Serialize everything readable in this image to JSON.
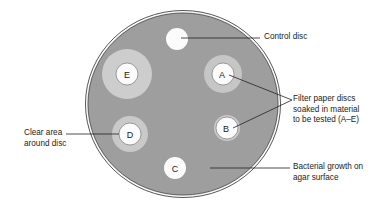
{
  "diagram": {
    "colors": {
      "background": "#ffffff",
      "agar": "#9e9e9e",
      "plate_rim": "#555555",
      "clear_zone": "#cdcdcd",
      "disc": "#fbfbfb",
      "leader_line": "#222222",
      "text": "#222222"
    },
    "plate": {
      "cx": 183,
      "cy": 104,
      "rx": 96,
      "ry": 92
    },
    "discs": [
      {
        "id": "control",
        "label": "",
        "cx": 177,
        "cy": 39,
        "r": 11,
        "zone_r": 0
      },
      {
        "id": "A",
        "label": "A",
        "cx": 223,
        "cy": 74,
        "r": 11,
        "zone_r": 19
      },
      {
        "id": "B",
        "label": "B",
        "cx": 227,
        "cy": 128,
        "r": 11,
        "zone_r": 13
      },
      {
        "id": "C",
        "label": "C",
        "cx": 175,
        "cy": 168,
        "r": 11,
        "zone_r": 0
      },
      {
        "id": "D",
        "label": "D",
        "cx": 130,
        "cy": 134,
        "r": 11,
        "zone_r": 18
      },
      {
        "id": "E",
        "label": "E",
        "cx": 127,
        "cy": 74,
        "r": 11,
        "zone_r": 25
      }
    ],
    "annotations": {
      "control_disc": "Control disc",
      "filter_paper_line1": "Filter paper discs",
      "filter_paper_line2": "soaked in material",
      "filter_paper_line3": "to be tested (A–E)",
      "clear_area_line1": "Clear area",
      "clear_area_line2": "around disc",
      "bacterial_line1": "Bacterial growth on",
      "bacterial_line2": "agar surface"
    }
  }
}
